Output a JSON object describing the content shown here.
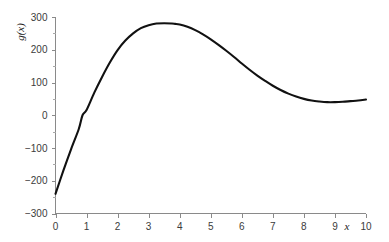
{
  "chart_data": {
    "type": "line",
    "title": "",
    "subtitle": "",
    "xlabel": "x",
    "ylabel": "g(x)",
    "xlim": [
      0,
      10
    ],
    "ylim": [
      -300,
      300
    ],
    "grid": false,
    "legend": null,
    "x_ticks": [
      0,
      1,
      2,
      3,
      4,
      5,
      6,
      7,
      8,
      9,
      10
    ],
    "x_tick_labels": [
      "0",
      "1",
      "2",
      "3",
      "4",
      "5",
      "6",
      "7",
      "8",
      "9",
      "10"
    ],
    "y_ticks": [
      -300,
      -200,
      -100,
      0,
      100,
      200,
      300
    ],
    "y_tick_labels": [
      "−300",
      "−200",
      "−100",
      "0",
      "100",
      "200",
      "300"
    ],
    "y_minor_ticks": [
      -250,
      -150,
      -50,
      50,
      150,
      250
    ],
    "series": [
      {
        "name": "g(x)",
        "color": "#111111",
        "line_width": 2.1,
        "x": [
          0,
          0.25,
          0.5,
          0.75,
          0.87,
          1,
          1.25,
          1.5,
          1.75,
          2,
          2.25,
          2.5,
          2.75,
          3,
          3.25,
          3.5,
          3.75,
          3.85,
          4,
          4.25,
          4.5,
          4.75,
          5,
          5.25,
          5.5,
          5.75,
          6,
          6.25,
          6.5,
          6.75,
          7,
          7.25,
          7.5,
          7.75,
          8,
          8.25,
          8.5,
          8.75,
          9,
          9.25,
          9.5,
          9.75,
          10
        ],
        "y": [
          -240,
          -170,
          -104,
          -42,
          0,
          16,
          69,
          117,
          161,
          199,
          228,
          250,
          266,
          275,
          280,
          281,
          280,
          279,
          277,
          270,
          260,
          247,
          232,
          215,
          197,
          178,
          158,
          139,
          121,
          105,
          90,
          77,
          66,
          57,
          50,
          45,
          42,
          40,
          40,
          41,
          43,
          45,
          48
        ]
      }
    ],
    "annotations": {
      "peak": {
        "x": 3.8,
        "y": 281
      },
      "local_min": {
        "x": 9.0,
        "y": 40
      },
      "start": {
        "x": 0,
        "y": -240
      },
      "zero_crossing": {
        "x": 0.87,
        "y": 0
      },
      "end": {
        "x": 10,
        "y": 48
      }
    }
  },
  "axes": {
    "y_axis_title": "g(x)",
    "x_axis_title": "x"
  }
}
